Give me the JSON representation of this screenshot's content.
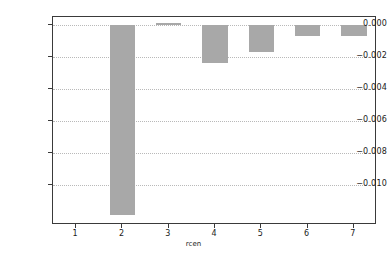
{
  "chart_data": {
    "type": "bar",
    "title": "",
    "subtitle": "",
    "xlabel": "rcen",
    "ylabel": "",
    "categories": [
      "1",
      "2",
      "3",
      "4",
      "5",
      "6",
      "7"
    ],
    "values": [
      0.0,
      -0.0119,
      0.0001,
      -0.0024,
      -0.0017,
      -0.0007,
      -0.0007
    ],
    "series": [
      {
        "name": "",
        "values": [
          0.0,
          -0.0119,
          0.0001,
          -0.0024,
          -0.0017,
          -0.0007,
          -0.0007
        ]
      }
    ],
    "ylim": [
      -0.0125,
      0.0005
    ],
    "xlim": [
      0.5,
      7.5
    ],
    "ytick_labels": [
      "0.000",
      "−0.002",
      "−0.004",
      "−0.006",
      "−0.008",
      "−0.010"
    ],
    "ytick_values": [
      0.0,
      -0.002,
      -0.004,
      -0.006,
      -0.008,
      -0.01
    ],
    "xtick_labels": [
      "1",
      "2",
      "3",
      "4",
      "5",
      "6",
      "7"
    ],
    "xtick_values": [
      1,
      2,
      3,
      4,
      5,
      6,
      7
    ],
    "grid": true,
    "grid_axis": "y",
    "legend": false,
    "legend_position": "none",
    "bar_color": "#a8a8a8",
    "grid_color": "#b9b9b9",
    "frame_color": "#3a3a3a",
    "background_color": "#ffffff",
    "bar_width_fraction": 0.55
  }
}
